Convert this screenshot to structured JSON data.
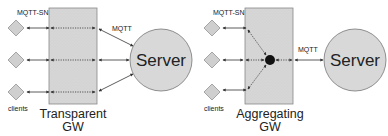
{
  "diagrams": [
    {
      "id": "transparent",
      "gateway_label_line1": "Transparent",
      "gateway_label_line2": "GW",
      "client_protocol_label": "MQTT-SN",
      "server_protocol_label": "MQTT",
      "server_label": "Server",
      "clients_label": "clients",
      "client_count": 3
    },
    {
      "id": "aggregating",
      "gateway_label_line1": "Aggregating",
      "gateway_label_line2": "GW",
      "client_protocol_label": "MQTT-SN",
      "server_protocol_label": "MQTT",
      "server_label": "Server",
      "clients_label": "clients",
      "client_count": 3
    }
  ],
  "colors": {
    "box_fill": "#d6d6d6",
    "box_stroke": "#888888",
    "circle_fill": "#d8d8d8",
    "circle_stroke": "#777777",
    "diamond_fill": "#cfcfcf",
    "line": "#333333"
  }
}
